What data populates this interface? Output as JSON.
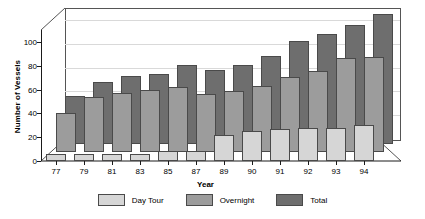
{
  "chart_data": {
    "type": "bar",
    "title": "",
    "xlabel": "Year",
    "ylabel": "Number of Vessels",
    "categories": [
      "77",
      "79",
      "81",
      "83",
      "85",
      "87",
      "89",
      "90",
      "91",
      "92",
      "93",
      "94"
    ],
    "series": [
      {
        "name": "Day Tour",
        "color": "#d6d6d6",
        "values": [
          6,
          6,
          6,
          6,
          8,
          8,
          22,
          25,
          27,
          28,
          28,
          30
        ]
      },
      {
        "name": "Overnight",
        "color": "#9c9c9c",
        "values": [
          33,
          46,
          50,
          52,
          55,
          49,
          51,
          56,
          63,
          68,
          79,
          80
        ]
      },
      {
        "name": "Total",
        "color": "#6e6e6e",
        "values": [
          40,
          52,
          57,
          59,
          66,
          62,
          66,
          74,
          86,
          92,
          100,
          109
        ]
      }
    ],
    "ylim": [
      0,
      110
    ],
    "yticks": [
      0,
      20,
      40,
      60,
      80,
      100
    ],
    "ytick_labels": [
      "0",
      "20",
      "40",
      "60",
      "80",
      "100"
    ],
    "grid": true,
    "legend_position": "bottom",
    "style": "3d-clustered-depth"
  },
  "legend": {
    "items": [
      {
        "label": "Day Tour",
        "swatch": "sw-day"
      },
      {
        "label": "Overnight",
        "swatch": "sw-over"
      },
      {
        "label": "Total",
        "swatch": "sw-total"
      }
    ]
  }
}
